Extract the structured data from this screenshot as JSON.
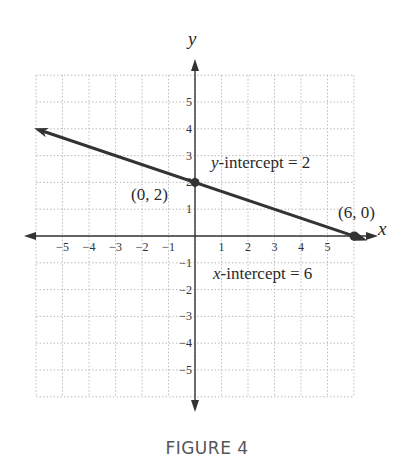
{
  "caption": "FIGURE 4",
  "axes": {
    "x_label": "x",
    "y_label": "y"
  },
  "colors": {
    "line": "#333333",
    "axis": "#333333",
    "grid": "#bbbbbb",
    "text": "#2a2a2a"
  },
  "annotations": {
    "y_intercept_point": "(0, 2)",
    "x_intercept_point": "(6, 0)",
    "y_intercept_label_var": "y",
    "y_intercept_label_rest": "-intercept = 2",
    "x_intercept_label_var": "x",
    "x_intercept_label_rest": "-intercept = 6"
  },
  "chart_data": {
    "type": "line",
    "title": "FIGURE 4",
    "xlabel": "x",
    "ylabel": "y",
    "xlim": [
      -6,
      6
    ],
    "ylim": [
      -6,
      6
    ],
    "grid": true,
    "x_ticks": [
      -5,
      -4,
      -3,
      -2,
      -1,
      1,
      2,
      3,
      4,
      5
    ],
    "y_ticks": [
      5,
      4,
      3,
      2,
      1,
      -1,
      -2,
      -3,
      -4,
      -5
    ],
    "series": [
      {
        "name": "line",
        "equation": "y = -x/3 + 2",
        "x": [
          -6,
          0,
          6
        ],
        "y": [
          4,
          2,
          0
        ]
      }
    ],
    "points": [
      {
        "x": 0,
        "y": 2,
        "label": "(0, 2)"
      },
      {
        "x": 6,
        "y": 0,
        "label": "(6, 0)"
      }
    ],
    "annotations": [
      "y-intercept = 2",
      "x-intercept = 6"
    ]
  }
}
